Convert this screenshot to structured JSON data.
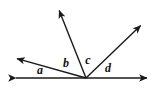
{
  "figure": {
    "kind": "angle-diagram",
    "stroke_color": "#1a1a1a",
    "label_color": "#111111",
    "background_color": "#ffffff",
    "width": 158,
    "height": 89,
    "vertex": {
      "x": 86,
      "y": 78
    },
    "baseline": {
      "name": "straight-line",
      "x1": 10,
      "y1": 78,
      "x2": 152,
      "y2": 78,
      "arrow_start": true,
      "arrow_end": true
    },
    "rays": [
      {
        "name": "ray-upper-left",
        "x": 12,
        "y": 57,
        "arrow": true
      },
      {
        "name": "ray-near-vertical",
        "x": 57,
        "y": 5,
        "arrow": true
      },
      {
        "name": "ray-upper-right",
        "x": 145,
        "y": 22,
        "arrow": true
      }
    ],
    "labels": [
      {
        "id": "a",
        "text": "a",
        "x": 40,
        "y": 70
      },
      {
        "id": "b",
        "text": "b",
        "x": 66,
        "y": 63
      },
      {
        "id": "c",
        "text": "c",
        "x": 88,
        "y": 60
      },
      {
        "id": "d",
        "text": "d",
        "x": 108,
        "y": 68
      }
    ]
  }
}
